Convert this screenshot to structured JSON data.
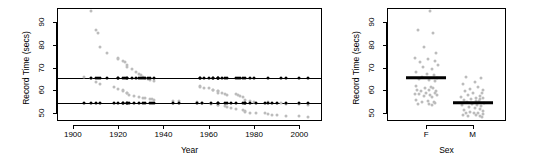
{
  "figure": {
    "background": "#ffffff",
    "observed_color": "#bcbcbc",
    "fitted_color": "#000000"
  },
  "chart_data": [
    {
      "type": "scatter",
      "panel": "left",
      "title": "",
      "xlabel": "Year",
      "ylabel": "Record Time (secs)",
      "xlim": [
        1893,
        2010
      ],
      "ylim": [
        47,
        96
      ],
      "xticks": [
        1900,
        1920,
        1940,
        1960,
        1980,
        2000
      ],
      "xticklabels": [
        "1900",
        "1920",
        "1940",
        "1960",
        "1980",
        "2000"
      ],
      "yticks": [
        50,
        60,
        70,
        80,
        90
      ],
      "yticklabels": [
        "50",
        "60",
        "70",
        "80",
        "90"
      ],
      "grid": false,
      "legend": "none",
      "series": [
        {
          "name": "Observed record time (F)",
          "color": "#bcbcbc",
          "marker": "circle",
          "x": [
            1908,
            1910,
            1911,
            1912,
            1915,
            1920,
            1920,
            1922,
            1923,
            1924,
            1924,
            1926,
            1928,
            1929,
            1930,
            1931,
            1932,
            1933,
            1934,
            1936,
            1956,
            1956,
            1958,
            1960,
            1962,
            1962,
            1964,
            1964,
            1964,
            1966,
            1967,
            1968,
            1972,
            1973,
            1974,
            1975,
            1976,
            1978,
            1980,
            1986,
            1992,
            1994,
            2000,
            2004
          ],
          "y": [
            95.0,
            86.6,
            85.0,
            78.8,
            76.5,
            74.0,
            73.6,
            72.8,
            72.2,
            71.0,
            70.4,
            69.4,
            68.0,
            67.0,
            66.6,
            66.0,
            65.4,
            65.0,
            64.6,
            64.0,
            62.0,
            61.6,
            61.2,
            61.2,
            60.2,
            60.0,
            59.5,
            59.5,
            59.0,
            58.9,
            58.5,
            58.0,
            58.5,
            58.0,
            57.5,
            57.0,
            55.6,
            55.4,
            54.8,
            55.0,
            54.5,
            54.0,
            53.8,
            53.5
          ]
        },
        {
          "name": "Observed record time (M)",
          "color": "#bcbcbc",
          "marker": "circle",
          "x": [
            1905,
            1908,
            1910,
            1912,
            1918,
            1920,
            1922,
            1922,
            1924,
            1924,
            1925,
            1927,
            1929,
            1931,
            1932,
            1934,
            1935,
            1936,
            1944,
            1947,
            1955,
            1957,
            1961,
            1964,
            1964,
            1967,
            1968,
            1970,
            1972,
            1975,
            1976,
            1976,
            1978,
            1981,
            1985,
            1986,
            1988,
            1990,
            1994,
            2000,
            2004
          ],
          "y": [
            65.8,
            65.6,
            63.8,
            62.8,
            61.4,
            60.4,
            60.0,
            59.6,
            59.0,
            58.6,
            58.0,
            57.4,
            57.0,
            56.8,
            56.4,
            56.0,
            56.0,
            55.8,
            55.4,
            55.2,
            54.8,
            54.6,
            54.0,
            53.6,
            53.4,
            53.0,
            52.6,
            52.2,
            51.8,
            51.4,
            51.0,
            50.6,
            50.2,
            50.0,
            49.8,
            49.4,
            49.2,
            49.0,
            48.8,
            48.6,
            48.4
          ]
        },
        {
          "name": "Fitted value (F)",
          "color": "#000000",
          "marker": "circle",
          "fit_line_y": 65.4,
          "x": [
            1908,
            1910,
            1911,
            1912,
            1915,
            1920,
            1920,
            1922,
            1923,
            1924,
            1924,
            1926,
            1928,
            1929,
            1930,
            1931,
            1932,
            1933,
            1934,
            1936,
            1956,
            1956,
            1958,
            1960,
            1962,
            1962,
            1964,
            1964,
            1964,
            1966,
            1967,
            1968,
            1972,
            1973,
            1974,
            1975,
            1976,
            1978,
            1980,
            1986,
            1992,
            1994,
            2000,
            2004
          ],
          "y": [
            65.4,
            65.4,
            65.4,
            65.4,
            65.4,
            65.4,
            65.4,
            65.4,
            65.4,
            65.4,
            65.4,
            65.4,
            65.4,
            65.4,
            65.4,
            65.4,
            65.4,
            65.4,
            65.4,
            65.4,
            65.4,
            65.4,
            65.4,
            65.4,
            65.4,
            65.4,
            65.4,
            65.4,
            65.4,
            65.4,
            65.4,
            65.4,
            65.4,
            65.4,
            65.4,
            65.4,
            65.4,
            65.4,
            65.4,
            65.4,
            65.4,
            65.4,
            65.4,
            65.4
          ]
        },
        {
          "name": "Fitted value (M)",
          "color": "#000000",
          "marker": "circle",
          "fit_line_y": 54.4,
          "x": [
            1905,
            1908,
            1910,
            1912,
            1918,
            1920,
            1922,
            1922,
            1924,
            1924,
            1925,
            1927,
            1929,
            1931,
            1932,
            1934,
            1935,
            1936,
            1944,
            1947,
            1955,
            1957,
            1961,
            1964,
            1964,
            1967,
            1968,
            1970,
            1972,
            1975,
            1976,
            1976,
            1978,
            1981,
            1985,
            1986,
            1988,
            1990,
            1994,
            2000,
            2004
          ],
          "y": [
            54.4,
            54.4,
            54.4,
            54.4,
            54.4,
            54.4,
            54.4,
            54.4,
            54.4,
            54.4,
            54.4,
            54.4,
            54.4,
            54.4,
            54.4,
            54.4,
            54.4,
            54.4,
            54.4,
            54.4,
            54.4,
            54.4,
            54.4,
            54.4,
            54.4,
            54.4,
            54.4,
            54.4,
            54.4,
            54.4,
            54.4,
            54.4,
            54.4,
            54.4,
            54.4,
            54.4,
            54.4,
            54.4,
            54.4,
            54.4,
            54.4
          ]
        }
      ]
    },
    {
      "type": "scatter",
      "panel": "right",
      "title": "",
      "xlabel": "Sex",
      "ylabel": "Record Time (secs)",
      "categories": [
        "F",
        "M"
      ],
      "ylim": [
        47,
        96
      ],
      "yticks": [
        50,
        60,
        70,
        80,
        90
      ],
      "yticklabels": [
        "50",
        "60",
        "70",
        "80",
        "90"
      ],
      "grid": false,
      "legend": "none",
      "group_means": [
        65.4,
        54.4
      ],
      "series": [
        {
          "name": "F",
          "color": "#bcbcbc",
          "marker": "circle",
          "category": "F",
          "jitter": [
            0.1,
            -0.22,
            0.18,
            -0.05,
            0.26,
            -0.3,
            0.05,
            0.22,
            -0.16,
            0.3,
            -0.08,
            0.14,
            -0.26,
            0.02,
            0.2,
            -0.12,
            0.28,
            -0.2,
            0.08,
            0.24,
            -0.28,
            0.12,
            -0.04,
            0.18,
            -0.24,
            0.06,
            0.26,
            -0.14,
            0.0,
            0.22,
            -0.3,
            0.1,
            -0.18,
            0.28,
            -0.06,
            0.16,
            -0.26,
            0.04,
            0.2,
            -0.1,
            0.24,
            -0.22,
            0.08,
            0.14
          ],
          "y": [
            95.0,
            86.6,
            85.0,
            78.8,
            76.5,
            74.0,
            73.6,
            72.8,
            72.2,
            71.0,
            70.4,
            69.4,
            68.0,
            67.0,
            66.6,
            66.0,
            65.4,
            65.0,
            64.6,
            64.0,
            62.0,
            61.6,
            61.2,
            61.2,
            60.2,
            60.0,
            59.5,
            59.5,
            59.0,
            58.9,
            58.5,
            58.0,
            58.5,
            58.0,
            57.5,
            57.0,
            55.6,
            55.4,
            54.8,
            55.0,
            54.5,
            54.0,
            53.8,
            53.5
          ]
        },
        {
          "name": "M",
          "color": "#bcbcbc",
          "marker": "circle",
          "category": "M",
          "jitter": [
            -0.18,
            0.22,
            0.06,
            -0.26,
            0.14,
            -0.08,
            0.28,
            -0.2,
            0.02,
            0.24,
            -0.12,
            0.18,
            -0.3,
            0.1,
            0.26,
            -0.04,
            0.2,
            -0.24,
            0.08,
            0.16,
            -0.14,
            0.3,
            -0.02,
            0.12,
            -0.28,
            0.22,
            -0.1,
            0.06,
            0.18,
            -0.22,
            0.26,
            -0.06,
            0.14,
            -0.18,
            0.04,
            0.28,
            -0.26,
            0.1,
            0.2,
            -0.12,
            0.24
          ],
          "y": [
            65.8,
            65.6,
            63.8,
            62.8,
            61.4,
            60.4,
            60.0,
            59.6,
            59.0,
            58.6,
            58.0,
            57.4,
            57.0,
            56.8,
            56.4,
            56.0,
            56.0,
            55.8,
            55.4,
            55.2,
            54.8,
            54.6,
            54.0,
            53.6,
            53.4,
            53.0,
            52.6,
            52.2,
            51.8,
            51.4,
            51.0,
            50.6,
            50.2,
            50.0,
            49.8,
            49.4,
            49.2,
            49.0,
            48.8,
            48.6,
            48.4
          ]
        }
      ]
    }
  ]
}
